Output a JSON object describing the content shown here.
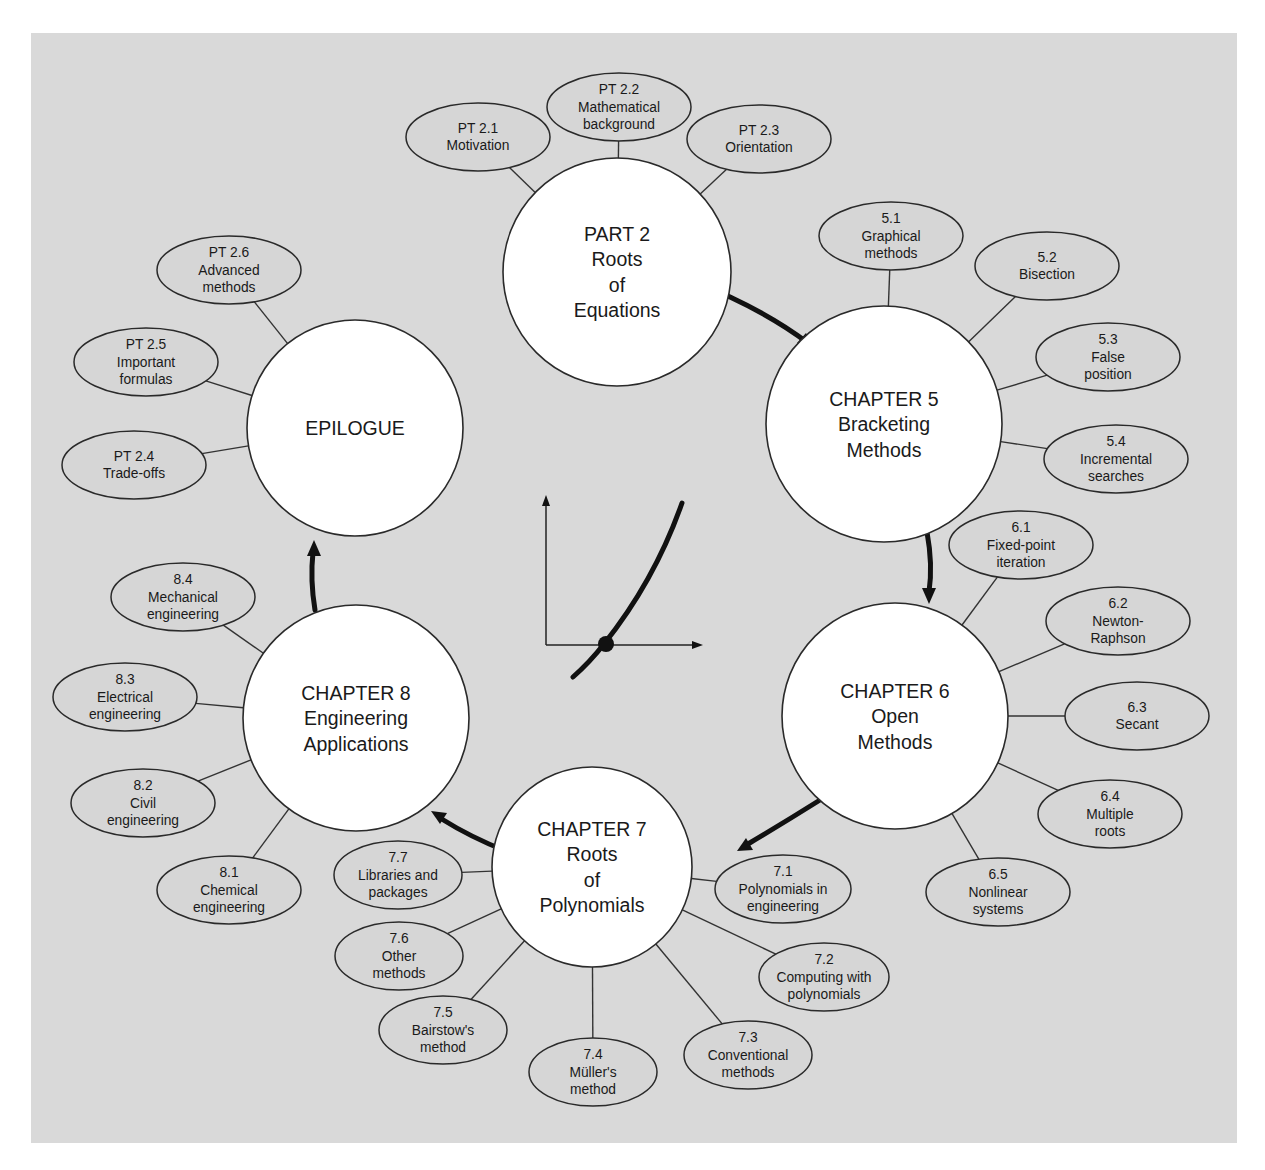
{
  "diagram": {
    "colors": {
      "background": "#d9d9d9",
      "big_node_fill": "#ffffff",
      "stroke": "#2a2a2a"
    },
    "big_nodes": [
      {
        "id": "part2",
        "lines": [
          "PART 2",
          "Roots",
          "of",
          "Equations"
        ],
        "cx": 617,
        "cy": 272,
        "r": 114
      },
      {
        "id": "ch5",
        "lines": [
          "CHAPTER 5",
          "Bracketing",
          "Methods"
        ],
        "cx": 884,
        "cy": 424,
        "r": 118
      },
      {
        "id": "ch6",
        "lines": [
          "CHAPTER 6",
          "Open",
          "Methods"
        ],
        "cx": 895,
        "cy": 716,
        "r": 113
      },
      {
        "id": "ch7",
        "lines": [
          "CHAPTER 7",
          "Roots",
          "of",
          "Polynomials"
        ],
        "cx": 592,
        "cy": 867,
        "r": 100
      },
      {
        "id": "ch8",
        "lines": [
          "CHAPTER 8",
          "Engineering",
          "Applications"
        ],
        "cx": 356,
        "cy": 718,
        "r": 113
      },
      {
        "id": "epilogue",
        "lines": [
          "EPILOGUE"
        ],
        "cx": 355,
        "cy": 428,
        "r": 108
      }
    ],
    "sub_nodes": [
      {
        "parent": "part2",
        "lines": [
          "PT 2.1",
          "Motivation"
        ],
        "cx": 478,
        "cy": 137,
        "rx": 72,
        "ry": 34
      },
      {
        "parent": "part2",
        "lines": [
          "PT 2.2",
          "Mathematical",
          "background"
        ],
        "cx": 619,
        "cy": 107,
        "rx": 72,
        "ry": 34
      },
      {
        "parent": "part2",
        "lines": [
          "PT 2.3",
          "Orientation"
        ],
        "cx": 759,
        "cy": 139,
        "rx": 72,
        "ry": 34
      },
      {
        "parent": "ch5",
        "lines": [
          "5.1",
          "Graphical",
          "methods"
        ],
        "cx": 891,
        "cy": 236,
        "rx": 72,
        "ry": 34
      },
      {
        "parent": "ch5",
        "lines": [
          "5.2",
          "Bisection"
        ],
        "cx": 1047,
        "cy": 266,
        "rx": 72,
        "ry": 34
      },
      {
        "parent": "ch5",
        "lines": [
          "5.3",
          "False",
          "position"
        ],
        "cx": 1108,
        "cy": 357,
        "rx": 72,
        "ry": 34
      },
      {
        "parent": "ch5",
        "lines": [
          "5.4",
          "Incremental",
          "searches"
        ],
        "cx": 1116,
        "cy": 459,
        "rx": 72,
        "ry": 34
      },
      {
        "parent": "ch6",
        "lines": [
          "6.1",
          "Fixed-point",
          "iteration"
        ],
        "cx": 1021,
        "cy": 545,
        "rx": 72,
        "ry": 34
      },
      {
        "parent": "ch6",
        "lines": [
          "6.2",
          "Newton-",
          "Raphson"
        ],
        "cx": 1118,
        "cy": 621,
        "rx": 72,
        "ry": 34
      },
      {
        "parent": "ch6",
        "lines": [
          "6.3",
          "Secant"
        ],
        "cx": 1137,
        "cy": 716,
        "rx": 72,
        "ry": 34
      },
      {
        "parent": "ch6",
        "lines": [
          "6.4",
          "Multiple",
          "roots"
        ],
        "cx": 1110,
        "cy": 814,
        "rx": 72,
        "ry": 34
      },
      {
        "parent": "ch6",
        "lines": [
          "6.5",
          "Nonlinear",
          "systems"
        ],
        "cx": 998,
        "cy": 892,
        "rx": 72,
        "ry": 34
      },
      {
        "parent": "ch7",
        "lines": [
          "7.1",
          "Polynomials in",
          "engineering"
        ],
        "cx": 783,
        "cy": 889,
        "rx": 68,
        "ry": 34
      },
      {
        "parent": "ch7",
        "lines": [
          "7.2",
          "Computing with",
          "polynomials"
        ],
        "cx": 824,
        "cy": 977,
        "rx": 65,
        "ry": 34
      },
      {
        "parent": "ch7",
        "lines": [
          "7.3",
          "Conventional",
          "methods"
        ],
        "cx": 748,
        "cy": 1055,
        "rx": 64,
        "ry": 34
      },
      {
        "parent": "ch7",
        "lines": [
          "7.4",
          "Müller's",
          "method"
        ],
        "cx": 593,
        "cy": 1072,
        "rx": 64,
        "ry": 34
      },
      {
        "parent": "ch7",
        "lines": [
          "7.5",
          "Bairstow's",
          "method"
        ],
        "cx": 443,
        "cy": 1030,
        "rx": 64,
        "ry": 34
      },
      {
        "parent": "ch7",
        "lines": [
          "7.6",
          "Other",
          "methods"
        ],
        "cx": 399,
        "cy": 956,
        "rx": 64,
        "ry": 34
      },
      {
        "parent": "ch7",
        "lines": [
          "7.7",
          "Libraries and",
          "packages"
        ],
        "cx": 398,
        "cy": 875,
        "rx": 64,
        "ry": 34
      },
      {
        "parent": "ch8",
        "lines": [
          "8.1",
          "Chemical",
          "engineering"
        ],
        "cx": 229,
        "cy": 890,
        "rx": 72,
        "ry": 34
      },
      {
        "parent": "ch8",
        "lines": [
          "8.2",
          "Civil",
          "engineering"
        ],
        "cx": 143,
        "cy": 803,
        "rx": 72,
        "ry": 34
      },
      {
        "parent": "ch8",
        "lines": [
          "8.3",
          "Electrical",
          "engineering"
        ],
        "cx": 125,
        "cy": 697,
        "rx": 72,
        "ry": 34
      },
      {
        "parent": "ch8",
        "lines": [
          "8.4",
          "Mechanical",
          "engineering"
        ],
        "cx": 183,
        "cy": 597,
        "rx": 72,
        "ry": 34
      },
      {
        "parent": "epilogue",
        "lines": [
          "PT 2.4",
          "Trade-offs"
        ],
        "cx": 134,
        "cy": 465,
        "rx": 72,
        "ry": 34
      },
      {
        "parent": "epilogue",
        "lines": [
          "PT 2.5",
          "Important",
          "formulas"
        ],
        "cx": 146,
        "cy": 362,
        "rx": 72,
        "ry": 34
      },
      {
        "parent": "epilogue",
        "lines": [
          "PT 2.6",
          "Advanced",
          "methods"
        ],
        "cx": 229,
        "cy": 270,
        "rx": 72,
        "ry": 34
      }
    ],
    "flow_arrows": [
      {
        "from": "part2",
        "to": "ch5",
        "path": "M728,296 Q775,318 808,343",
        "head": [
          814,
          348,
          797,
          343,
          806,
          333
        ]
      },
      {
        "from": "ch5",
        "to": "ch6",
        "path": "M927,532 Q933,565 929,592",
        "head": [
          929,
          604,
          922,
          588,
          936,
          588
        ]
      },
      {
        "from": "ch6",
        "to": "ch7",
        "path": "M820,800 Q785,822 748,844",
        "head": [
          737,
          851,
          746,
          838,
          753,
          850
        ]
      },
      {
        "from": "ch7",
        "to": "ch8",
        "path": "M506,851 Q472,838 440,818",
        "head": [
          431,
          811,
          447,
          813,
          440,
          824
        ]
      },
      {
        "from": "ch8",
        "to": "epilogue",
        "path": "M315,610 Q310,580 313,552",
        "head": [
          314,
          540,
          307,
          556,
          321,
          556
        ]
      }
    ],
    "center_graphic": {
      "icon": "root-of-function-plot",
      "x_axis": {
        "x1": 546,
        "y1": 645,
        "x2": 703,
        "y2": 645
      },
      "y_axis": {
        "x1": 546,
        "y1": 645,
        "x2": 546,
        "y2": 495
      },
      "curve": "M573,677 Q590,662 604,644 Q655,580 682,503",
      "root_point": {
        "cx": 606,
        "cy": 644,
        "r": 8
      }
    }
  }
}
